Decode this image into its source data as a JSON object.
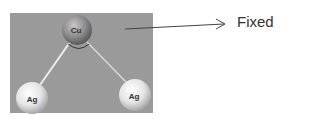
{
  "diagram": {
    "annotation": {
      "label": "Fixed"
    },
    "atoms": [
      {
        "id": "center",
        "label": "Cu"
      },
      {
        "id": "left",
        "label": "Ag"
      },
      {
        "id": "right",
        "label": "Ag"
      }
    ],
    "colors": {
      "panel": "#9a9a9a",
      "cu_sphere": "#8c8c8c",
      "ag_sphere": "#e8e8e8",
      "bond": "#e6e6e6"
    }
  }
}
